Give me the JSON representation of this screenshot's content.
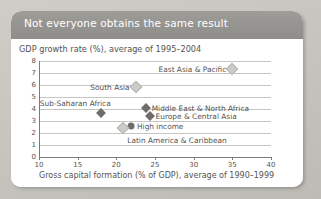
{
  "card": {
    "title": "Not everyone obtains the same result",
    "header_color": "#8f8d89",
    "background_color": "#ffffff"
  },
  "chart_data": {
    "type": "scatter",
    "title": "Not everyone obtains the same result",
    "ylabel": "GDP growth rate (%), average of 1995–2004",
    "xlabel": "Gross capital formation (% of GDP), average of 1990–1999",
    "xlim": [
      10,
      40
    ],
    "ylim": [
      0,
      8
    ],
    "xticks": [
      "10",
      "15",
      "20",
      "25",
      "30",
      "35",
      "40"
    ],
    "yticks": [
      "0",
      "1",
      "2",
      "3",
      "4",
      "5",
      "6",
      "7",
      "8"
    ],
    "grid": "horizontal",
    "legend": "none",
    "marker_colors": {
      "dark": "#6f6d69",
      "light": "#cdcbc7"
    },
    "points": [
      {
        "label": "East Asia & Pacific",
        "x": 35.0,
        "y": 7.3,
        "marker": "diamond",
        "shade": "light",
        "label_side": "left"
      },
      {
        "label": "South Asia",
        "x": 22.5,
        "y": 5.85,
        "marker": "diamond",
        "shade": "light",
        "label_side": "left"
      },
      {
        "label": "Sub-Saharan Africa",
        "x": 18.0,
        "y": 3.7,
        "marker": "diamond",
        "shade": "dark",
        "label_side": "above-left"
      },
      {
        "label": "Middle East & North Africa",
        "x": 23.8,
        "y": 4.1,
        "marker": "diamond",
        "shade": "dark",
        "label_side": "right"
      },
      {
        "label": "Europe & Central Asia",
        "x": 24.3,
        "y": 3.45,
        "marker": "diamond",
        "shade": "dark",
        "label_side": "right"
      },
      {
        "label": "High income",
        "x": 21.9,
        "y": 2.6,
        "marker": "circle",
        "shade": "dark",
        "label_side": "right"
      },
      {
        "label": "Latin America & Caribbean",
        "x": 20.9,
        "y": 2.45,
        "marker": "diamond",
        "shade": "light",
        "label_side": "below-right"
      }
    ]
  }
}
